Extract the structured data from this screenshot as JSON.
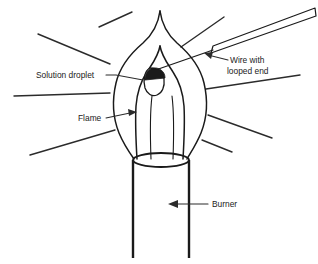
{
  "diagram": {
    "background_color": "#ffffff",
    "ink_color": "#1a1a1a",
    "labels": {
      "solution_droplet": "Solution droplet",
      "flame": "Flame",
      "wire_line1": "Wire with",
      "wire_line2": "looped end",
      "burner": "Burner"
    },
    "parts": {
      "flame_outer": "flame-outer-cone",
      "flame_inner": "flame-inner-cone",
      "droplet": "solution-droplet",
      "wire": "wire-with-looped-end",
      "burner_tube": "burner-tube",
      "burner_rim": "burner-rim-ellipse",
      "heat_rays": "radiating-heat-lines"
    },
    "ray_count": 8
  }
}
